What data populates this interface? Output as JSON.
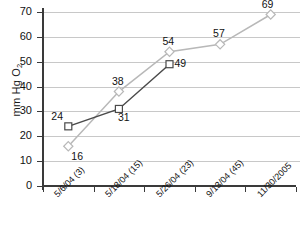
{
  "chart_data": {
    "type": "line",
    "title": "",
    "xlabel": "",
    "ylabel": "mm Hg O2",
    "ylabel_prefix": "mm Hg O",
    "ylabel_sub": "2",
    "categories": [
      "5/6/04 (3)",
      "5/18/04 (15)",
      "5/26/04 (23)",
      "9/13/04 (45)",
      "11/30/2005"
    ],
    "ylim": [
      0,
      70
    ],
    "yticks": [
      0,
      10,
      20,
      30,
      40,
      50,
      60,
      70
    ],
    "grid": true,
    "legend": "none",
    "series": [
      {
        "name": "series-light-diamond",
        "marker": "diamond",
        "color": "#b8b8b8",
        "values": [
          16,
          38,
          54,
          57,
          69
        ],
        "labels": [
          "16",
          "38",
          "54",
          "57",
          "69"
        ]
      },
      {
        "name": "series-dark-square",
        "marker": "square",
        "color": "#4a4a4a",
        "values": [
          24,
          31,
          49,
          null,
          null
        ],
        "labels": [
          "24",
          "31",
          "49"
        ]
      }
    ]
  },
  "axis": {
    "y_tick_labels": [
      "0",
      "10",
      "20",
      "30",
      "40",
      "50",
      "60",
      "70"
    ],
    "x_tick_labels": [
      "5/6/04 (3)",
      "5/18/04 (15)",
      "5/26/04 (23)",
      "9/13/04 (45)",
      "11/30/2005"
    ]
  },
  "colors": {
    "axis": "#3a3a3a",
    "grid": "#c8c8c8",
    "series_light": "#b8b8b8",
    "series_dark": "#4a4a4a",
    "text": "#111111",
    "background": "#ffffff"
  }
}
